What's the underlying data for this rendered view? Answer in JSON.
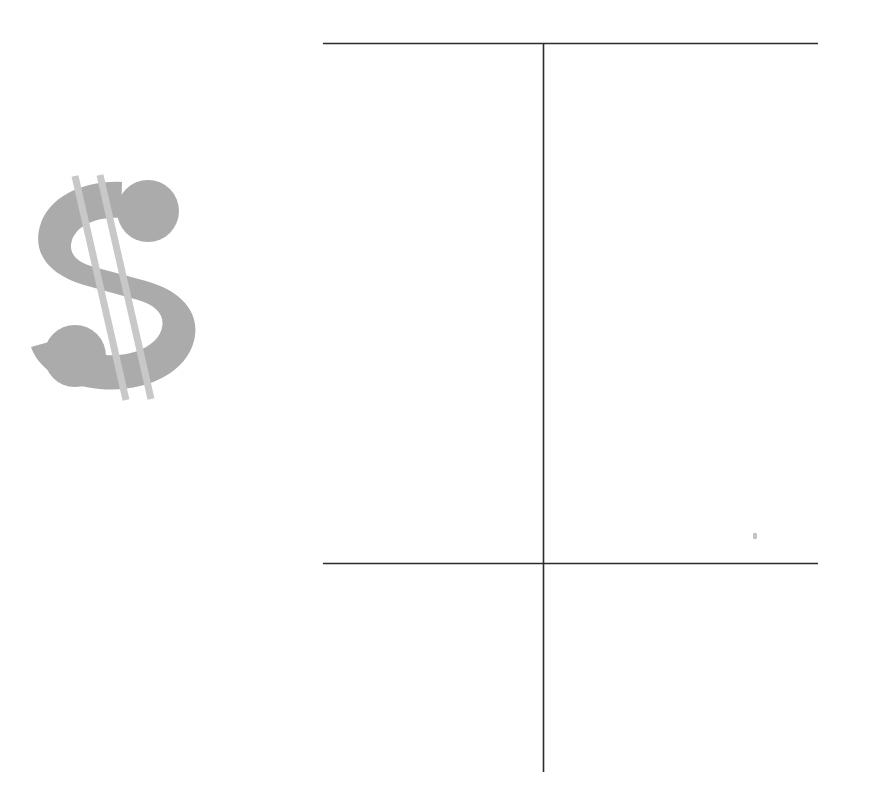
{
  "page": {
    "kind": "scanned-figure",
    "width": 874,
    "height": 794,
    "background_color": "#ffffff"
  },
  "dollar_symbol": {
    "name": "dollar-sign-glyph",
    "character": "$",
    "style": "bold-slashed",
    "body_color": "#ababab",
    "slash_color": "#c8c8c8",
    "slash_count": 2,
    "bounds": {
      "x": 28,
      "y": 178,
      "width": 162,
      "height": 225
    }
  },
  "line_figure": {
    "name": "cross-rule-diagram",
    "stroke_color": "#2b2b2b",
    "stroke_width": 1.6,
    "horizontal_rules": [
      {
        "label": "top-rule",
        "y": 43,
        "x1": 323,
        "x2": 818
      },
      {
        "label": "lower-rule",
        "y": 563,
        "x1": 323,
        "x2": 818
      }
    ],
    "vertical_rules": [
      {
        "label": "center-rule",
        "x": 543,
        "y1": 43,
        "y2": 772
      }
    ]
  },
  "artifacts": {
    "speck": {
      "name": "scan-speck",
      "x": 755,
      "y": 536,
      "color": "#b9b9b9"
    }
  }
}
